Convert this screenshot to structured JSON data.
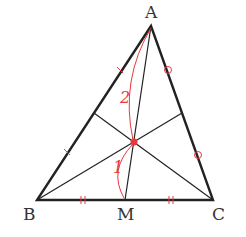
{
  "diagram": {
    "type": "triangle-centroid",
    "colors": {
      "line": "#222222",
      "accent": "#e8383d",
      "label": "#333333"
    },
    "vertices": {
      "A": {
        "label": "A",
        "x": 151,
        "y": 26
      },
      "B": {
        "label": "B",
        "x": 37,
        "y": 200
      },
      "C": {
        "label": "C",
        "x": 213,
        "y": 200
      }
    },
    "midpoint": {
      "label": "M",
      "x": 125,
      "y": 200
    },
    "centroid": {
      "x": 134,
      "y": 142
    },
    "ratio_labels": {
      "upper": "2",
      "lower": "1"
    },
    "equal_marks": {
      "AB": "single-tick",
      "AC": "circle",
      "BC": "double-tick"
    }
  }
}
